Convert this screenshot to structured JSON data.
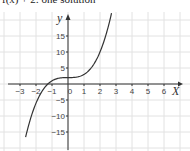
{
  "caption": "f(x) + 2: one solution",
  "chart_data": {
    "type": "line",
    "title": "f(x) + 2: one solution",
    "xlabel": "X",
    "ylabel": "y",
    "xlim": [
      -3.5,
      7
    ],
    "ylim": [
      -19,
      22
    ],
    "x_ticks": [
      -3,
      -2,
      -1,
      0,
      1,
      2,
      3,
      4,
      5,
      6
    ],
    "x_tick_labels": [
      "−3",
      "−2",
      "−1",
      "0",
      "1",
      "2",
      "3",
      "4",
      "5",
      "6"
    ],
    "y_ticks": [
      -15,
      -10,
      -5,
      5,
      10,
      15
    ],
    "y_tick_labels": [
      "−15",
      "−10",
      "−5",
      "5",
      "10",
      "15"
    ],
    "grid": true,
    "series": [
      {
        "name": "y = x^3 + 2",
        "function": "x^3 + 2",
        "x_range": [
          -2.65,
          2.72
        ],
        "color": "#333333"
      }
    ]
  }
}
